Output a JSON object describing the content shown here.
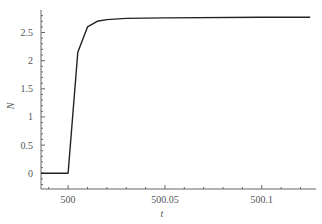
{
  "chart_data": {
    "type": "line",
    "title": "",
    "xlabel": "t",
    "ylabel": "N",
    "xlim": [
      499.986,
      500.128
    ],
    "ylim": [
      -0.28,
      2.9
    ],
    "x_ticks": [
      500,
      500.05,
      500.1
    ],
    "x_tick_labels": [
      "500",
      "500.05",
      "500.1"
    ],
    "y_ticks": [
      0,
      0.5,
      1,
      1.5,
      2,
      2.5
    ],
    "y_tick_labels": [
      "0",
      "0.5",
      "1",
      "1.5",
      "2",
      "2.5"
    ],
    "grid": false,
    "series": [
      {
        "name": "N(t)",
        "color": "#222222",
        "x": [
          499.986,
          500.0,
          500.005,
          500.01,
          500.015,
          500.02,
          500.03,
          500.05,
          500.1,
          500.125
        ],
        "y": [
          0,
          0,
          2.15,
          2.6,
          2.7,
          2.73,
          2.75,
          2.76,
          2.77,
          2.77
        ]
      }
    ]
  }
}
